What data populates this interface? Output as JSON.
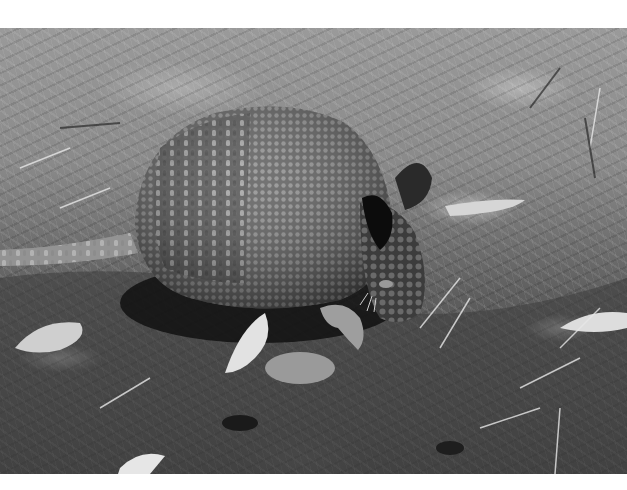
{
  "image": {
    "subject": "nine-banded armadillo digging in the ground",
    "style": "black-and-white photograph",
    "colors": {
      "background_page": "#ffffff",
      "soil_dark": "#3a3a3a",
      "shell": "#6e6e6e",
      "shadow": "#111111"
    },
    "elements": [
      "armadillo-body",
      "armadillo-tail",
      "armadillo-ear",
      "armadillo-head",
      "armadillo-claw",
      "fallen-leaves",
      "dry-grass",
      "soil"
    ]
  }
}
